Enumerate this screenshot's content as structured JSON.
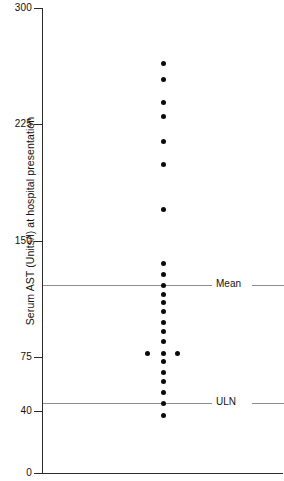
{
  "chart_data": {
    "type": "scatter",
    "title": "",
    "subtitle": "",
    "xlabel": "",
    "ylabel": "Serum AST (Units/l) at hospital presentation",
    "ylim": [
      0,
      300
    ],
    "xlim": [
      0,
      1
    ],
    "grid": false,
    "legend_position": "none",
    "y_ticks": [
      {
        "value": 300,
        "label": "300"
      },
      {
        "value": 225,
        "label": "225"
      },
      {
        "value": 150,
        "label": "150"
      },
      {
        "value": 75,
        "label": "75"
      },
      {
        "value": 40,
        "label": "40"
      },
      {
        "value": 0,
        "label": "0"
      }
    ],
    "x_ticks": [],
    "series": [
      {
        "name": "Patients",
        "values": [
          264,
          254,
          239,
          230,
          214,
          199,
          170,
          135,
          128,
          121,
          115,
          110,
          104,
          97,
          91,
          85,
          77,
          77,
          77,
          72,
          65,
          59,
          52,
          45,
          37
        ],
        "x_jitter": [
          0,
          0,
          0,
          0,
          0,
          0,
          0,
          0,
          0,
          0,
          0,
          0,
          0,
          0,
          0,
          0,
          -16,
          0,
          14,
          0,
          0,
          0,
          0,
          0,
          0
        ],
        "marker": "filled-circle",
        "color": "#0b0b0b",
        "count": 25
      }
    ],
    "reference_lines": [
      {
        "label": "Mean",
        "value": 121,
        "color": "#8d8d8d"
      },
      {
        "label": "ULN",
        "value": 45,
        "color": "#8d8d8d"
      }
    ],
    "annotations": []
  },
  "colors": {
    "axis": "#2b2b2b",
    "dot": "#0b0b0b",
    "reference": "#8d8d8d",
    "text": "#111111",
    "background": "#ffffff"
  }
}
